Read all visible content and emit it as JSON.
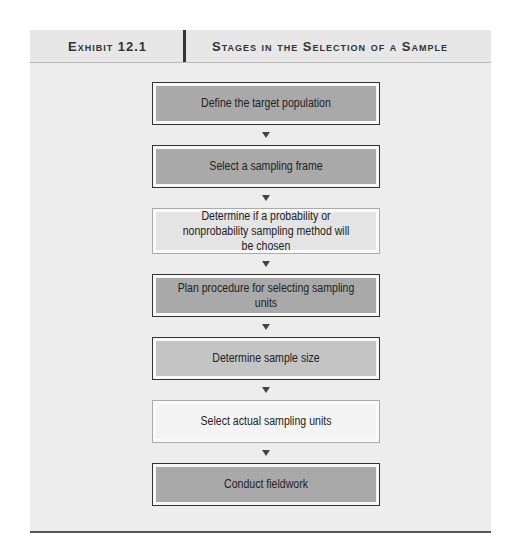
{
  "header": {
    "exhibit_label": "Exhibit 12.1",
    "title": "Stages in the Selection of a Sample"
  },
  "flowchart": {
    "steps": [
      {
        "label": "Define the target population",
        "shade": "dark",
        "fill": "#a9a9a9"
      },
      {
        "label": "Select a sampling frame",
        "shade": "dark",
        "fill": "#a9a9a9"
      },
      {
        "label": "Determine if a probability or nonprobability sampling method will be chosen",
        "shade": "light",
        "fill": "#e4e4e4"
      },
      {
        "label": "Plan procedure for selecting sampling units",
        "shade": "dark",
        "fill": "#a9a9a9"
      },
      {
        "label": "Determine sample size",
        "shade": "medium",
        "fill": "#c4c4c4"
      },
      {
        "label": "Select actual sampling units",
        "shade": "light",
        "fill": "#f2f2f2"
      },
      {
        "label": "Conduct fieldwork",
        "shade": "dark",
        "fill": "#a9a9a9"
      }
    ],
    "connector": "down-arrow"
  },
  "colors": {
    "panel_bg": "#ededed",
    "header_bg": "#e7e7e7",
    "rule": "#555555",
    "text": "#222222"
  }
}
